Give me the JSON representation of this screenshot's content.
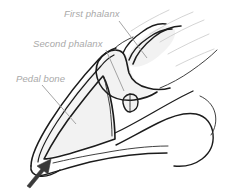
{
  "figure": {
    "background_color": "#ffffff",
    "width": 231,
    "height": 190
  },
  "style": {
    "label_color": "#a9a9a9",
    "leader_color": "#9a9a9a",
    "outline_color": "#1c1c1c",
    "bone_fill_color": "#f2f2f2",
    "shade_fill_color": "#ededed",
    "arrow_color": "#3a3a3a"
  },
  "labels": [
    {
      "id": "first-phalanx",
      "text": "First phalanx",
      "x": 64,
      "y": 17,
      "leader_from": [
        119,
        21
      ],
      "leader_to": [
        147,
        58
      ]
    },
    {
      "id": "second-phalanx",
      "text": "Second phalanx",
      "x": 33,
      "y": 47,
      "leader_from": [
        106,
        50
      ],
      "leader_to": [
        124,
        91
      ]
    },
    {
      "id": "pedal-bone",
      "text": "Pedal bone",
      "x": 16,
      "y": 82,
      "leader_from": [
        42,
        85
      ],
      "leader_to": [
        76,
        124
      ]
    }
  ],
  "annotations": [
    {
      "id": "sole-arrow",
      "kind": "arrow",
      "description": "arrow pointing up-right at the sole / toe region",
      "tail": [
        27,
        186
      ],
      "tip": [
        50,
        158
      ]
    }
  ],
  "anatomy_parts": [
    {
      "id": "hoof-wall",
      "name": "Hoof wall outline"
    },
    {
      "id": "coronary-band",
      "name": "Coronary band"
    },
    {
      "id": "pedal-bone-body",
      "name": "Pedal bone (distal phalanx)"
    },
    {
      "id": "second-phalanx-body",
      "name": "Second phalanx (middle phalanx)"
    },
    {
      "id": "first-phalanx-body",
      "name": "First phalanx (proximal phalanx)"
    },
    {
      "id": "navicular-bone",
      "name": "Navicular bone"
    },
    {
      "id": "heel-bulb",
      "name": "Heel bulb outline"
    },
    {
      "id": "sole-line",
      "name": "Sole line"
    }
  ]
}
